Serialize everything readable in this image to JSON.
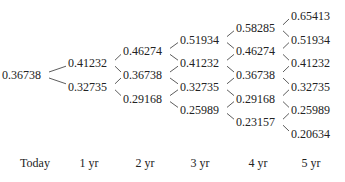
{
  "diagram": {
    "type": "binomial-interest-rate-tree",
    "columns": [
      {
        "label": "Today",
        "values": [
          "0.36738"
        ]
      },
      {
        "label": "1 yr",
        "values": [
          "0.41232",
          "0.32735"
        ]
      },
      {
        "label": "2 yr",
        "values": [
          "0.46274",
          "0.36738",
          "0.29168"
        ]
      },
      {
        "label": "3 yr",
        "values": [
          "0.51934",
          "0.41232",
          "0.32735",
          "0.25989"
        ]
      },
      {
        "label": "4 yr",
        "values": [
          "0.58285",
          "0.46274",
          "0.36738",
          "0.29168",
          "0.23157"
        ]
      },
      {
        "label": "5 yr",
        "values": [
          "0.65413",
          "0.51934",
          "0.41232",
          "0.32735",
          "0.25989",
          "0.20634"
        ]
      }
    ]
  },
  "timeline": {
    "labels": [
      "Today",
      "1 yr",
      "2 yr",
      "3 yr",
      "4 yr",
      "5 yr"
    ]
  },
  "colors": {
    "text": "#222222",
    "line": "#333333",
    "background": "#ffffff"
  }
}
